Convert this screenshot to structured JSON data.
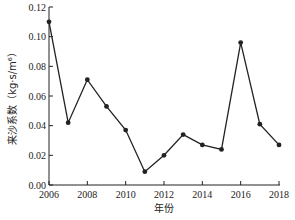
{
  "chart_data": {
    "type": "line",
    "title": "",
    "xlabel": "年份",
    "ylabel": "来沙系数（kg·s/m⁶）",
    "x": [
      2006,
      2007,
      2008,
      2009,
      2010,
      2011,
      2012,
      2013,
      2014,
      2015,
      2016,
      2017,
      2018
    ],
    "series": [
      {
        "name": "来沙系数",
        "values": [
          0.11,
          0.042,
          0.071,
          0.053,
          0.037,
          0.009,
          0.02,
          0.034,
          0.027,
          0.024,
          0.096,
          0.041,
          0.027
        ],
        "color": "#222222",
        "marker": "circle"
      }
    ],
    "xticks": [
      2006,
      2008,
      2010,
      2012,
      2014,
      2016,
      2018
    ],
    "xtick_labels": [
      "2006",
      "2008",
      "2010",
      "2012",
      "2014",
      "2016",
      "2018"
    ],
    "yticks": [
      0.0,
      0.02,
      0.04,
      0.06,
      0.08,
      0.1,
      0.12
    ],
    "ytick_labels": [
      "0.00",
      "0.02",
      "0.04",
      "0.06",
      "0.08",
      "0.10",
      "0.12"
    ],
    "xlim": [
      2006,
      2018
    ],
    "ylim": [
      0,
      0.12
    ],
    "grid": false,
    "legend": null
  }
}
